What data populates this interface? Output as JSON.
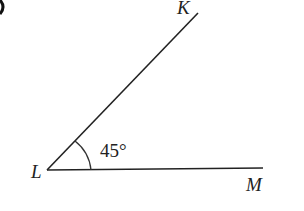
{
  "diagram": {
    "vertex_label": "L",
    "ray1_label": "K",
    "ray2_label": "M",
    "angle_label": "45°",
    "angle_degrees": 45
  }
}
